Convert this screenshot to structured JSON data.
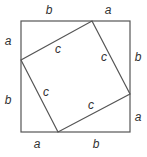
{
  "diagram": {
    "title": "",
    "outer_square": {
      "x": 21,
      "y": 21,
      "size": 109
    },
    "inner_square": {
      "vertices": [
        [
          92,
          21
        ],
        [
          130,
          94
        ],
        [
          58,
          132
        ],
        [
          21,
          60
        ]
      ]
    },
    "labels": {
      "top_left": "b",
      "top_right": "a",
      "right_top": "b",
      "right_bottom": "a",
      "bottom_right": "b",
      "bottom_left": "a",
      "left_bottom": "b",
      "left_top": "a",
      "inner_top": "c",
      "inner_right": "c",
      "inner_bottom": "c",
      "inner_left": "c"
    },
    "colors": {
      "stroke": "#555555",
      "text": "#333333",
      "background": "#ffffff"
    }
  }
}
